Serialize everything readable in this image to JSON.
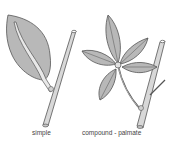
{
  "diagram": {
    "figures": [
      {
        "id": "simple",
        "label": "simple"
      },
      {
        "id": "compound-palmate",
        "label": "compound - palmate"
      }
    ],
    "colors": {
      "leaf_fill": "#b8b8b8",
      "stem_fill": "#d8d8d8",
      "outline": "#555555",
      "background": "#ffffff"
    }
  }
}
